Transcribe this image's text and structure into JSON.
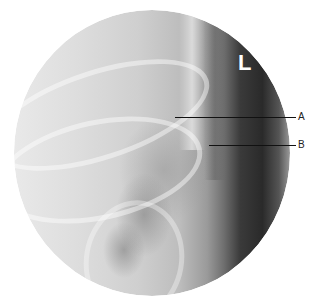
{
  "image": {
    "type": "radiograph",
    "side_marker": "L",
    "colors": {
      "background": "#ffffff",
      "marker": "#ffffff",
      "leader_line": "#111111"
    }
  },
  "annotations": [
    {
      "label": "A"
    },
    {
      "label": "B"
    }
  ]
}
